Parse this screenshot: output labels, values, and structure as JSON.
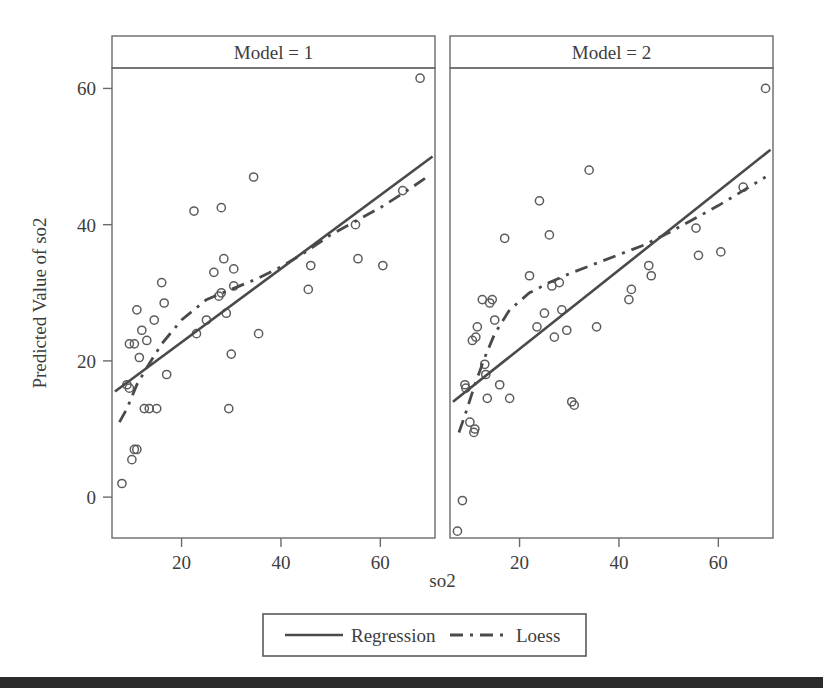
{
  "figure": {
    "xlabel": "so2",
    "ylabel": "Predicted Value of so2",
    "x_ticks": [
      "20",
      "40",
      "60"
    ],
    "y_ticks": [
      "0",
      "20",
      "40",
      "60"
    ],
    "panel_titles": [
      "Model = 1",
      "Model = 2"
    ],
    "legend": [
      {
        "label": "Regression",
        "style": "solid"
      },
      {
        "label": "Loess",
        "style": "dashed"
      }
    ],
    "colors": {
      "line": "#4a4a4a",
      "marker": "#5c5c5c",
      "frame": "#6a6a6a",
      "background": "#ffffff",
      "scanbar": "#2b2b2b"
    }
  },
  "chart_data": {
    "type": "scatter",
    "title": "",
    "xlabel": "so2",
    "ylabel": "Predicted Value of so2",
    "xlim": [
      6,
      71
    ],
    "ylim": [
      -6,
      63
    ],
    "xticks": [
      20,
      40,
      60
    ],
    "yticks": [
      0,
      20,
      40,
      60
    ],
    "grid": false,
    "legend_position": "bottom",
    "facet_variable": "Model",
    "panels": [
      {
        "name": "Model = 1",
        "points": [
          {
            "x": 8,
            "y": 2
          },
          {
            "x": 9,
            "y": 16.5
          },
          {
            "x": 9.5,
            "y": 16
          },
          {
            "x": 9.5,
            "y": 22.5
          },
          {
            "x": 10,
            "y": 5.5
          },
          {
            "x": 10.5,
            "y": 22.5
          },
          {
            "x": 10.5,
            "y": 7
          },
          {
            "x": 11,
            "y": 7
          },
          {
            "x": 11,
            "y": 27.5
          },
          {
            "x": 11.5,
            "y": 20.5
          },
          {
            "x": 12,
            "y": 24.5
          },
          {
            "x": 12.5,
            "y": 13
          },
          {
            "x": 13,
            "y": 23
          },
          {
            "x": 13.5,
            "y": 13
          },
          {
            "x": 14.5,
            "y": 26
          },
          {
            "x": 15,
            "y": 13
          },
          {
            "x": 16,
            "y": 31.5
          },
          {
            "x": 16.5,
            "y": 28.5
          },
          {
            "x": 17,
            "y": 18
          },
          {
            "x": 22.5,
            "y": 42
          },
          {
            "x": 23,
            "y": 24
          },
          {
            "x": 25,
            "y": 26
          },
          {
            "x": 26.5,
            "y": 33
          },
          {
            "x": 27.5,
            "y": 29.5
          },
          {
            "x": 28,
            "y": 42.5
          },
          {
            "x": 28,
            "y": 30
          },
          {
            "x": 28.5,
            "y": 35
          },
          {
            "x": 29,
            "y": 27
          },
          {
            "x": 29.5,
            "y": 13
          },
          {
            "x": 30,
            "y": 21
          },
          {
            "x": 30.5,
            "y": 31
          },
          {
            "x": 30.5,
            "y": 33.5
          },
          {
            "x": 34.5,
            "y": 47
          },
          {
            "x": 35.5,
            "y": 24
          },
          {
            "x": 45.5,
            "y": 30.5
          },
          {
            "x": 46,
            "y": 34
          },
          {
            "x": 55,
            "y": 40
          },
          {
            "x": 55.5,
            "y": 35
          },
          {
            "x": 60.5,
            "y": 34
          },
          {
            "x": 64.5,
            "y": 45
          },
          {
            "x": 68,
            "y": 61.5
          }
        ],
        "regression": {
          "x": [
            6.6,
            70.5
          ],
          "y": [
            15.5,
            50
          ]
        },
        "loess": {
          "x": [
            7.5,
            9,
            11,
            13,
            16,
            20,
            25,
            30,
            35,
            40,
            45,
            50,
            55,
            60,
            65,
            69
          ],
          "y": [
            11,
            13,
            16.5,
            19,
            22.5,
            26,
            29,
            30.5,
            32,
            33.8,
            36,
            38.5,
            40.5,
            42.5,
            44.8,
            46.8
          ]
        }
      },
      {
        "name": "Model = 2",
        "points": [
          {
            "x": 7.5,
            "y": -5
          },
          {
            "x": 8.5,
            "y": -0.5
          },
          {
            "x": 9,
            "y": 16.5
          },
          {
            "x": 9.2,
            "y": 16
          },
          {
            "x": 10,
            "y": 11
          },
          {
            "x": 10.5,
            "y": 23
          },
          {
            "x": 10.8,
            "y": 9.5
          },
          {
            "x": 11,
            "y": 10
          },
          {
            "x": 11.2,
            "y": 23.5
          },
          {
            "x": 11.5,
            "y": 25
          },
          {
            "x": 12.5,
            "y": 29
          },
          {
            "x": 13,
            "y": 19.5
          },
          {
            "x": 13.2,
            "y": 18
          },
          {
            "x": 13.5,
            "y": 14.5
          },
          {
            "x": 14,
            "y": 28.5
          },
          {
            "x": 14.5,
            "y": 29
          },
          {
            "x": 15,
            "y": 26
          },
          {
            "x": 16,
            "y": 16.5
          },
          {
            "x": 17,
            "y": 38
          },
          {
            "x": 18,
            "y": 14.5
          },
          {
            "x": 22,
            "y": 32.5
          },
          {
            "x": 23.5,
            "y": 25
          },
          {
            "x": 24,
            "y": 43.5
          },
          {
            "x": 25,
            "y": 27
          },
          {
            "x": 26,
            "y": 38.5
          },
          {
            "x": 26.5,
            "y": 31
          },
          {
            "x": 27,
            "y": 23.5
          },
          {
            "x": 28,
            "y": 31.5
          },
          {
            "x": 28.5,
            "y": 27.5
          },
          {
            "x": 29.5,
            "y": 24.5
          },
          {
            "x": 30.5,
            "y": 14
          },
          {
            "x": 31,
            "y": 13.5
          },
          {
            "x": 34,
            "y": 48
          },
          {
            "x": 35.5,
            "y": 25
          },
          {
            "x": 42,
            "y": 29
          },
          {
            "x": 42.5,
            "y": 30.5
          },
          {
            "x": 46,
            "y": 34
          },
          {
            "x": 46.5,
            "y": 32.5
          },
          {
            "x": 55.5,
            "y": 39.5
          },
          {
            "x": 56,
            "y": 35.5
          },
          {
            "x": 60.5,
            "y": 36
          },
          {
            "x": 65,
            "y": 45.5
          },
          {
            "x": 69.5,
            "y": 60
          }
        ],
        "regression": {
          "x": [
            6.6,
            70.5
          ],
          "y": [
            14,
            51
          ]
        },
        "loess": {
          "x": [
            7.8,
            9,
            11,
            13,
            15,
            18,
            22,
            26,
            30,
            35,
            40,
            45,
            50,
            55,
            60,
            65,
            69.5
          ],
          "y": [
            9.5,
            12,
            16.5,
            20.5,
            24,
            27.5,
            30,
            31.5,
            32.8,
            34.2,
            35.6,
            37,
            38.8,
            40.8,
            42.8,
            45,
            47
          ]
        }
      }
    ]
  }
}
